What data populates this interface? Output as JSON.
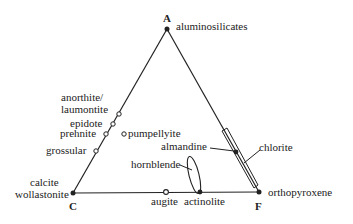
{
  "diagram": {
    "type": "ternary",
    "vertices": {
      "A": {
        "label": "A",
        "mineral": "aluminosilicates"
      },
      "C": {
        "label": "C",
        "mineral_line1": "calcite",
        "mineral_line2": "wollastonite"
      },
      "F": {
        "label": "F",
        "mineral": "orthopyroxene"
      }
    },
    "edge_AC_minerals": {
      "anorthite_line1": "anorthite/",
      "anorthite_line2": "laumontite",
      "epidote": "epidote",
      "prehnite": "prehnite",
      "grossular": "grossular"
    },
    "interior": {
      "pumpellyite": "pumpellyite",
      "hornblende": "hornblende"
    },
    "edge_AF_minerals": {
      "almandine": "almandine",
      "chlorite": "chlorite"
    },
    "edge_CF_minerals": {
      "augite": "augite",
      "actinolite": "actinolite"
    },
    "colors": {
      "line": "#222222",
      "background": "#ffffff"
    }
  }
}
